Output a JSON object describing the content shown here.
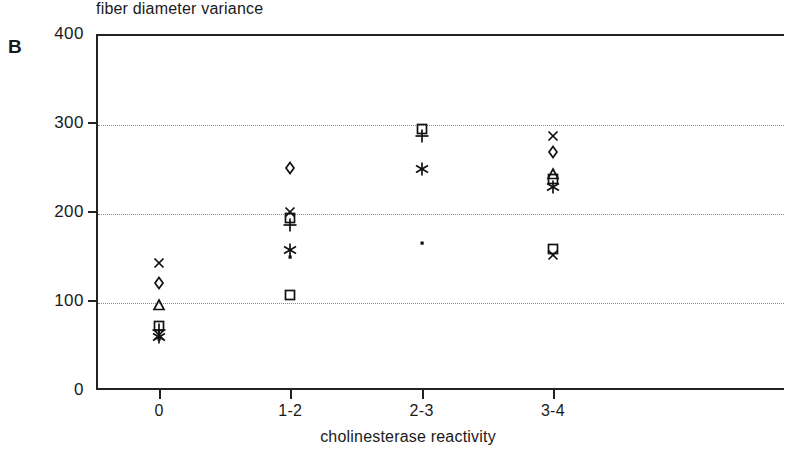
{
  "panel": {
    "label": "B"
  },
  "chart_data": {
    "type": "scatter",
    "title": "fiber diameter variance",
    "xlabel": "cholinesterase reactivity",
    "ylabel": "",
    "categories": [
      "0",
      "1-2",
      "2-3",
      "3-4"
    ],
    "yticks": [
      0,
      100,
      200,
      300,
      400
    ],
    "ylim": [
      0,
      400
    ],
    "grid": "horizontal dotted at 100, 200, 300",
    "legend": "none",
    "marker_glyphs": {
      "cross": "x-cross-marker",
      "diamond": "diamond-marker",
      "triangle": "triangle-marker",
      "square": "square-marker",
      "plus": "plus-marker",
      "asterisk": "asterisk-marker",
      "dot": "small-dot-marker"
    },
    "points": [
      {
        "category": "0",
        "value": 143,
        "marker": "cross"
      },
      {
        "category": "0",
        "value": 120,
        "marker": "diamond"
      },
      {
        "category": "0",
        "value": 95,
        "marker": "triangle"
      },
      {
        "category": "0",
        "value": 72,
        "marker": "square"
      },
      {
        "category": "0",
        "value": 67,
        "marker": "plus"
      },
      {
        "category": "0",
        "value": 62,
        "marker": "cross"
      },
      {
        "category": "0",
        "value": 59,
        "marker": "asterisk"
      },
      {
        "category": "0",
        "value": 57,
        "marker": "dot"
      },
      {
        "category": "1-2",
        "value": 250,
        "marker": "diamond"
      },
      {
        "category": "1-2",
        "value": 200,
        "marker": "cross"
      },
      {
        "category": "1-2",
        "value": 193,
        "marker": "square"
      },
      {
        "category": "1-2",
        "value": 185,
        "marker": "plus"
      },
      {
        "category": "1-2",
        "value": 157,
        "marker": "asterisk"
      },
      {
        "category": "1-2",
        "value": 150,
        "marker": "dot"
      },
      {
        "category": "1-2",
        "value": 107,
        "marker": "square"
      },
      {
        "category": "2-3",
        "value": 293,
        "marker": "square"
      },
      {
        "category": "2-3",
        "value": 285,
        "marker": "plus"
      },
      {
        "category": "2-3",
        "value": 248,
        "marker": "asterisk"
      },
      {
        "category": "2-3",
        "value": 165,
        "marker": "dot"
      },
      {
        "category": "3-4",
        "value": 285,
        "marker": "cross"
      },
      {
        "category": "3-4",
        "value": 267,
        "marker": "diamond"
      },
      {
        "category": "3-4",
        "value": 243,
        "marker": "triangle"
      },
      {
        "category": "3-4",
        "value": 237,
        "marker": "square"
      },
      {
        "category": "3-4",
        "value": 228,
        "marker": "asterisk"
      },
      {
        "category": "3-4",
        "value": 158,
        "marker": "square"
      },
      {
        "category": "3-4",
        "value": 152,
        "marker": "cross"
      }
    ]
  }
}
